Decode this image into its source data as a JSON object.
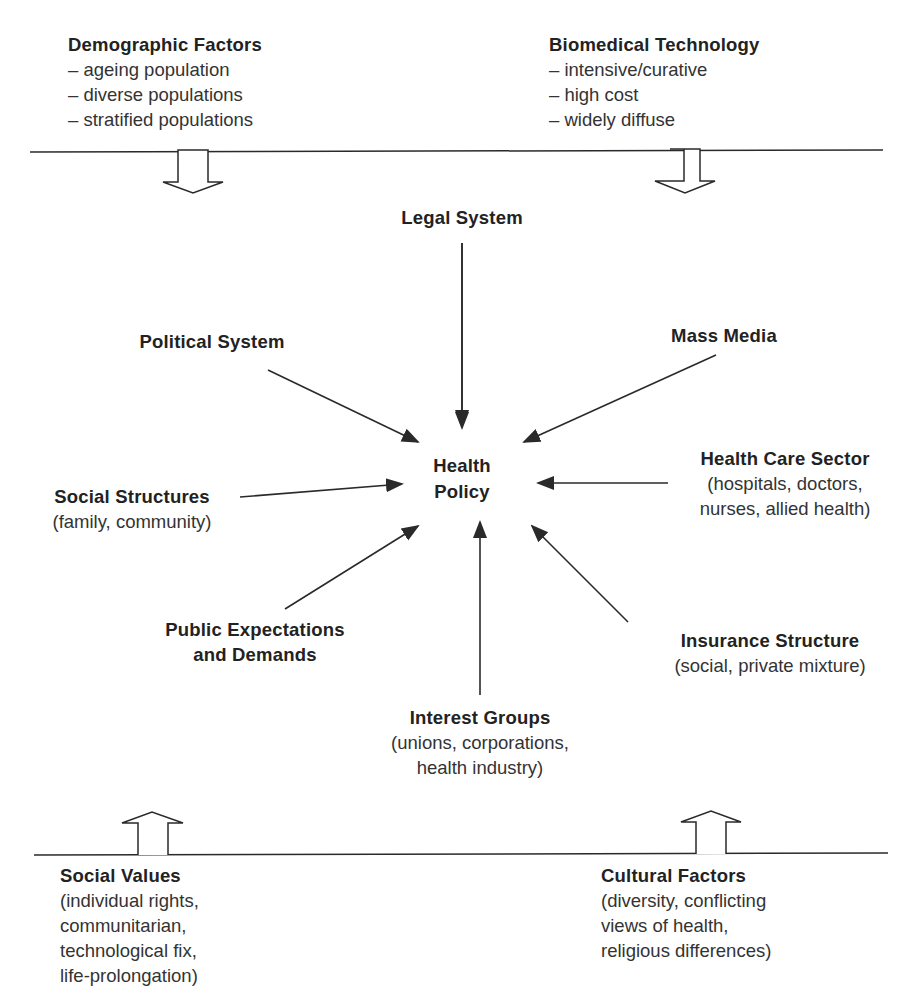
{
  "center": {
    "title_line1": "Health",
    "title_line2": "Policy"
  },
  "top_factors": [
    {
      "title": "Demographic Factors",
      "items": [
        "– ageing population",
        "– diverse populations",
        "– stratified populations"
      ]
    },
    {
      "title": "Biomedical Technology",
      "items": [
        "– intensive/curative",
        "– high cost",
        "– widely diffuse"
      ]
    }
  ],
  "bottom_factors": [
    {
      "title": "Social Values",
      "lines": [
        "(individual rights,",
        "communitarian,",
        "technological fix,",
        "life-prolongation)"
      ]
    },
    {
      "title": "Cultural Factors",
      "lines": [
        "(diversity, conflicting",
        "views of health,",
        "religious differences)"
      ]
    }
  ],
  "influences": {
    "legal": {
      "title": "Legal System"
    },
    "political": {
      "title": "Political System"
    },
    "media": {
      "title": "Mass Media"
    },
    "social_structures": {
      "title": "Social Structures",
      "lines": [
        "(family, community)"
      ]
    },
    "health_care": {
      "title": "Health Care Sector",
      "lines": [
        "(hospitals, doctors,",
        "nurses, allied health)"
      ]
    },
    "public": {
      "title_line1": "Public Expectations",
      "title_line2": "and Demands"
    },
    "insurance": {
      "title": "Insurance Structure",
      "lines": [
        "(social, private mixture)"
      ]
    },
    "interest": {
      "title": "Interest Groups",
      "lines": [
        "(unions, corporations,",
        "health industry)"
      ]
    }
  },
  "colors": {
    "ink": "#2a2a2a",
    "background": "#ffffff"
  }
}
